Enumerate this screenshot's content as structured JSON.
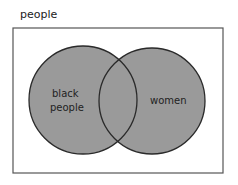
{
  "diagram": {
    "type": "venn",
    "universe_label": "people",
    "sets": [
      {
        "label_line1": "black",
        "label_line2": "people"
      },
      {
        "label": "women"
      }
    ],
    "colors": {
      "fill": "#9a9a9a",
      "stroke": "#2a2a2a",
      "frame": "#555555"
    }
  }
}
